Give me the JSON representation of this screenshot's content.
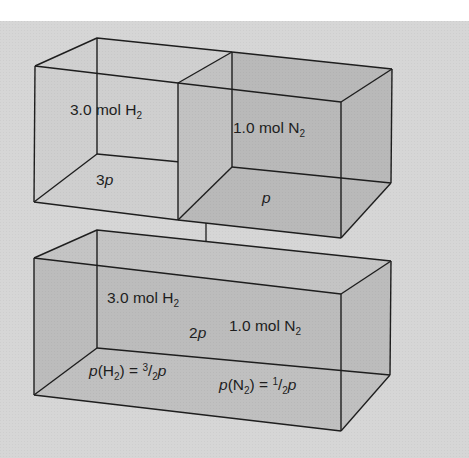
{
  "diagram": {
    "colors": {
      "background": "#d6d6d6",
      "page": "#ffffff",
      "box_face_light": "#c9c9c9",
      "box_face_dark": "#b4b4b4",
      "edge": "#1e1e1e"
    },
    "top_left_container": {
      "gas_amount": "3.0",
      "gas_unit": "mol",
      "gas_element": "H",
      "gas_subscript": "2",
      "pressure_coeff": "3",
      "pressure_symbol": "p"
    },
    "top_right_container": {
      "gas_amount": "1.0",
      "gas_unit": "mol",
      "gas_element": "N",
      "gas_subscript": "2",
      "pressure_coeff": "",
      "pressure_symbol": "p"
    },
    "arrow": {
      "direction": "down",
      "meaning": "containers combined"
    },
    "bottom_container": {
      "gas1_amount": "3.0",
      "gas1_unit": "mol",
      "gas1_element": "H",
      "gas1_subscript": "2",
      "gas2_amount": "1.0",
      "gas2_unit": "mol",
      "gas2_element": "N",
      "gas2_subscript": "2",
      "total_pressure_coeff": "2",
      "total_pressure_symbol": "p",
      "partial_h2": {
        "symbol": "p",
        "element": "H",
        "subscript": "2",
        "equals": "=",
        "numerator": "3",
        "slash": "/",
        "denominator": "2",
        "result_symbol": "p"
      },
      "partial_n2": {
        "symbol": "p",
        "element": "N",
        "subscript": "2",
        "equals": "=",
        "numerator": "1",
        "slash": "/",
        "denominator": "2",
        "result_symbol": "p"
      }
    }
  }
}
